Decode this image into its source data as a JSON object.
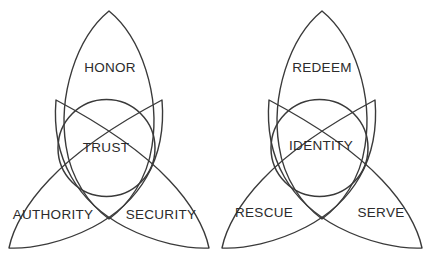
{
  "figure": {
    "kind": "triquetra-venn-pair",
    "background_color": "#ffffff",
    "stroke_color": "#3a3a3a",
    "text_color": "#2b2b2b",
    "width": 432,
    "height": 259
  },
  "diagrams": [
    {
      "id": "left",
      "center_label": "TRUST",
      "lobes": [
        {
          "position": "top",
          "label": "HONOR"
        },
        {
          "position": "bottom-left",
          "label": "AUTHORITY"
        },
        {
          "position": "bottom-right",
          "label": "SECURITY"
        }
      ]
    },
    {
      "id": "right",
      "center_label": "IDENTITY",
      "lobes": [
        {
          "position": "top",
          "label": "REDEEM"
        },
        {
          "position": "bottom-left",
          "label": "RESCUE"
        },
        {
          "position": "bottom-right",
          "label": "SERVE"
        }
      ]
    }
  ],
  "labels": {
    "left_top": "HONOR",
    "left_center": "TRUST",
    "left_bottom_left": "AUTHORITY",
    "left_bottom_right": "SECURITY",
    "right_top": "REDEEM",
    "right_center": "IDENTITY",
    "right_bottom_left": "RESCUE",
    "right_bottom_right": "SERVE"
  }
}
